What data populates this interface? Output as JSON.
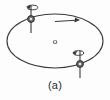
{
  "figure": {
    "caption": "(a)",
    "center_label": "o",
    "colors": {
      "background": "#fdfdfd",
      "stroke": "#3a3a3a",
      "node_fill": "#5a5a5a",
      "text": "#2a2a2a"
    },
    "orbit": {
      "name": "ellipse-path",
      "center_x": 55,
      "center_y": 41,
      "radius_x": 48,
      "radius_y": 27,
      "stroke_width": 1.1
    },
    "center_marker": {
      "x": 55,
      "y": 41,
      "label": "o"
    },
    "direction_arrow": {
      "name": "orbit-direction-arrow",
      "x1": 55,
      "y1": 22,
      "x2": 78,
      "y2": 20,
      "label": ""
    },
    "nodes": [
      {
        "id": "node-upper-left",
        "x": 31,
        "y": 19,
        "axis_top_y": 6,
        "axis_bottom_y": 33,
        "spin_label": "",
        "spin_cx": 33,
        "spin_cy": 7
      },
      {
        "id": "node-lower-right",
        "x": 80,
        "y": 64,
        "axis_top_y": 51,
        "axis_bottom_y": 78,
        "spin_label": "",
        "spin_cx": 78,
        "spin_cy": 52
      }
    ]
  }
}
